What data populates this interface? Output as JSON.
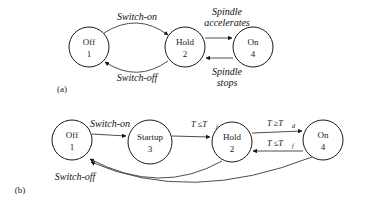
{
  "figure": {
    "background": "#ffffff",
    "stroke_color": "#1a1a1a",
    "edge_color": "#3a3a3a",
    "subfigures": [
      {
        "key": "a",
        "label": "(a)"
      },
      {
        "key": "b",
        "label": "(b)"
      }
    ]
  },
  "diagram_a": {
    "caption": "(a)",
    "states": [
      {
        "id": "off",
        "name": "Off",
        "number": "1",
        "cx": 89,
        "cy": 47,
        "r": 20
      },
      {
        "id": "hold",
        "name": "Hold",
        "number": "2",
        "cx": 185,
        "cy": 47,
        "r": 20
      },
      {
        "id": "on",
        "name": "On",
        "number": "4",
        "cx": 253,
        "cy": 47,
        "r": 20
      }
    ],
    "transitions": [
      {
        "id": "off-to-hold",
        "from": "off",
        "to": "hold",
        "label": "Switch-on",
        "label_lines": [
          "Switch-on"
        ]
      },
      {
        "id": "hold-to-off",
        "from": "hold",
        "to": "off",
        "label": "Switch-off",
        "label_lines": [
          "Switch-off"
        ]
      },
      {
        "id": "hold-to-on",
        "from": "hold",
        "to": "on",
        "label": "Spindle accelerates",
        "label_lines": [
          "Spindle",
          "accelerates"
        ]
      },
      {
        "id": "on-to-hold",
        "from": "on",
        "to": "hold",
        "label": "Spindle stops",
        "label_lines": [
          "Spindle",
          "stops"
        ]
      }
    ]
  },
  "diagram_b": {
    "caption": "(b)",
    "states": [
      {
        "id": "off",
        "name": "Off",
        "number": "1",
        "cx": 72,
        "cy": 140,
        "r": 20
      },
      {
        "id": "startup",
        "name": "Startup",
        "number": "3",
        "cx": 150,
        "cy": 142,
        "r": 22
      },
      {
        "id": "hold",
        "name": "Hold",
        "number": "2",
        "cx": 232,
        "cy": 142,
        "r": 20
      },
      {
        "id": "on",
        "name": "On",
        "number": "4",
        "cx": 323,
        "cy": 140,
        "r": 20
      }
    ],
    "transitions": [
      {
        "id": "off-to-startup",
        "from": "off",
        "to": "startup",
        "label": "Switch-on",
        "base": "Switch-on",
        "subscript": ""
      },
      {
        "id": "startup-to-hold",
        "from": "startup",
        "to": "hold",
        "label": "T ≤ Tf",
        "base": "T ≤T",
        "subscript": "f"
      },
      {
        "id": "hold-to-on",
        "from": "hold",
        "to": "on",
        "label": "T ≥ Td",
        "base": "T ≥T",
        "subscript": "d"
      },
      {
        "id": "on-to-hold",
        "from": "on",
        "to": "hold",
        "label": "T ≤ Tf",
        "base": "T ≤T",
        "subscript": "f"
      },
      {
        "id": "hold-to-off",
        "from": "hold",
        "to": "off",
        "label": "Switch-off",
        "base": "Switch-off",
        "subscript": ""
      },
      {
        "id": "on-to-off",
        "from": "on",
        "to": "off",
        "label": "Switch-off",
        "base": "Switch-off",
        "subscript": ""
      }
    ],
    "shared_labels": [
      {
        "id": "switch-off-label",
        "text": "Switch-off"
      }
    ]
  }
}
